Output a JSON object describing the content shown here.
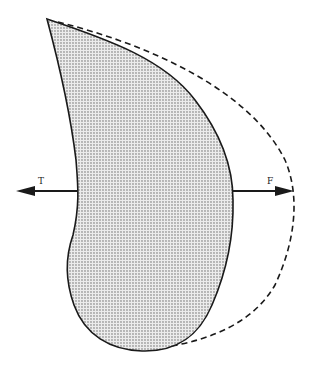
{
  "diagram": {
    "colors": {
      "background": "#ffffff",
      "stroke": "#1a1a1a",
      "stipple_dot": "#555555",
      "fill_base": "#e6e6e6"
    },
    "shapes": {
      "body": {
        "name": "stippled-teardrop",
        "style": "solid outline, dotted fill"
      },
      "outline": {
        "name": "dashed-contour",
        "style": "dashed"
      }
    },
    "arrows": [
      {
        "id": "T",
        "label": "T",
        "direction": "left"
      },
      {
        "id": "F",
        "label": "F",
        "direction": "right"
      }
    ]
  }
}
